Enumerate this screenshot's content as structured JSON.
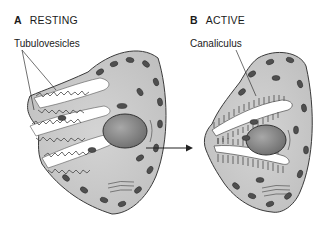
{
  "panels": [
    {
      "letter": "A",
      "title": "RESTING",
      "label": "Tubulovesicles"
    },
    {
      "letter": "B",
      "title": "ACTIVE",
      "label": "Canaliculus"
    }
  ],
  "colors": {
    "cytoplasm": "#c9c9c9",
    "outline": "#3a3a3a",
    "nucleus": "#8c8c8c",
    "mitochondria": "#4a4a4a",
    "lumen": "#ffffff"
  }
}
